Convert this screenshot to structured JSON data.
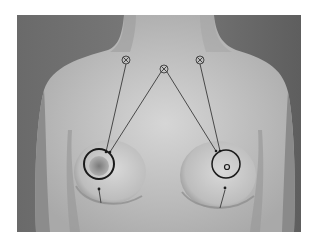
{
  "figure": {
    "caption": "",
    "photo": {
      "x": 17,
      "y": 15,
      "width": 284,
      "height": 217,
      "background": "#6e6e6e",
      "skin": "#c8c8c8"
    },
    "markers": [
      {
        "id": "left-clavicle-marker",
        "cx": 126,
        "cy": 60,
        "r": 4,
        "glyph": "circle-x"
      },
      {
        "id": "sternal-notch-marker",
        "cx": 164,
        "cy": 69,
        "r": 4,
        "glyph": "circle-x"
      },
      {
        "id": "right-clavicle-marker",
        "cx": 200,
        "cy": 60,
        "r": 4,
        "glyph": "circle-x"
      }
    ],
    "areola_outlines": [
      {
        "id": "left-areola-outline",
        "cx": 99,
        "cy": 164,
        "r": 15,
        "stroke": "#1a1a1a",
        "stroke_width": 2
      },
      {
        "id": "right-areola-outline",
        "cx": 226,
        "cy": 164,
        "r": 14,
        "stroke": "#1a1a1a",
        "stroke_width": 1.5
      }
    ],
    "nipple_marker": {
      "id": "right-nipple-marker",
      "cx": 227,
      "cy": 167,
      "r": 2.5
    },
    "lines": [
      {
        "from": [
          126,
          64
        ],
        "to": [
          106,
          152
        ]
      },
      {
        "from": [
          161,
          72
        ],
        "to": [
          110,
          152
        ]
      },
      {
        "from": [
          167,
          72
        ],
        "to": [
          216,
          151
        ]
      },
      {
        "from": [
          200,
          64
        ],
        "to": [
          220,
          151
        ]
      },
      {
        "from": [
          101,
          203
        ],
        "to": [
          99,
          188
        ]
      },
      {
        "from": [
          220,
          208
        ],
        "to": [
          225,
          188
        ]
      }
    ],
    "colors": {
      "line": "#3a3a3a",
      "marker": "#3a3a3a",
      "outline": "#1a1a1a"
    }
  }
}
